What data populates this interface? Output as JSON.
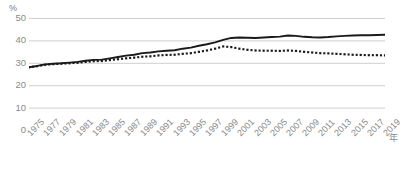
{
  "chart_data": {
    "type": "line",
    "title": "",
    "subtitle": "",
    "xlabel": "年",
    "ylabel": "%",
    "ylim": [
      0,
      50
    ],
    "xlim": [
      1975,
      2019
    ],
    "grid": true,
    "legend_position": "none",
    "yticks": [
      50,
      40,
      30,
      20,
      10,
      0
    ],
    "ytick_labels": [
      "50",
      "40",
      "30",
      "20",
      "10",
      "0"
    ],
    "xticks": [
      1975,
      1977,
      1979,
      1981,
      1983,
      1985,
      1987,
      1989,
      1991,
      1993,
      1995,
      1997,
      1999,
      2001,
      2003,
      2005,
      2007,
      2009,
      2011,
      2013,
      2015,
      2017,
      2019
    ],
    "xtick_labels": [
      "1975",
      "1977",
      "1979",
      "1981",
      "1983",
      "1985",
      "1987",
      "1989",
      "1991",
      "1993",
      "1995",
      "1997",
      "1999",
      "2001",
      "2003",
      "2005",
      "2007",
      "2009",
      "2011",
      "2013",
      "2015",
      "2017",
      "2019"
    ],
    "x": [
      1975,
      1976,
      1977,
      1978,
      1979,
      1980,
      1981,
      1982,
      1983,
      1984,
      1985,
      1986,
      1987,
      1988,
      1989,
      1990,
      1991,
      1992,
      1993,
      1994,
      1995,
      1996,
      1997,
      1998,
      1999,
      2000,
      2001,
      2002,
      2003,
      2004,
      2005,
      2006,
      2007,
      2008,
      2009,
      2010,
      2011,
      2012,
      2013,
      2014,
      2015,
      2016,
      2017,
      2018,
      2019
    ],
    "series": [
      {
        "name": "series-solid",
        "style": "solid",
        "color": "#1a1a1a",
        "values": [
          28.0,
          28.6,
          29.3,
          29.6,
          29.8,
          30.1,
          30.4,
          30.9,
          31.3,
          31.4,
          32.0,
          32.6,
          33.2,
          33.6,
          34.3,
          34.6,
          35.1,
          35.4,
          35.6,
          36.3,
          36.8,
          37.6,
          38.3,
          39.1,
          40.2,
          41.1,
          41.3,
          41.2,
          41.1,
          41.3,
          41.5,
          41.7,
          42.2,
          42.0,
          41.6,
          41.4,
          41.3,
          41.5,
          41.8,
          42.0,
          42.2,
          42.3,
          42.3,
          42.4,
          42.5
        ]
      },
      {
        "name": "series-dotted",
        "style": "dotted",
        "color": "#1a1a1a",
        "values": [
          28.0,
          28.5,
          29.1,
          29.4,
          29.6,
          29.8,
          30.0,
          30.4,
          30.7,
          30.8,
          31.2,
          31.6,
          32.0,
          32.3,
          32.7,
          32.9,
          33.3,
          33.5,
          33.6,
          34.0,
          34.3,
          34.9,
          35.5,
          36.3,
          37.3,
          37.0,
          36.3,
          35.8,
          35.5,
          35.4,
          35.4,
          35.3,
          35.5,
          35.3,
          34.9,
          34.6,
          34.3,
          34.2,
          34.0,
          33.8,
          33.6,
          33.5,
          33.4,
          33.4,
          33.3
        ]
      }
    ],
    "colors": {
      "grid": "#cfcfcf",
      "axis_text": "#8a8a8a",
      "line": "#1a1a1a",
      "background": "#ffffff"
    }
  }
}
